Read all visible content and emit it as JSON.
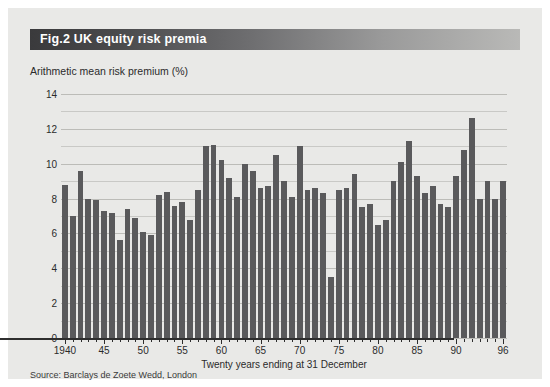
{
  "figure": {
    "label": "Fig.2",
    "title": "UK equity risk premia",
    "source": "Source: Barclays de Zoete Wedd, London",
    "accent_color": "#5a5a5c",
    "background_color": "#e9e9e7",
    "title_bar_dark": "#3a3a3c",
    "title_bar_light": "#b9b9b7"
  },
  "chart_data": {
    "type": "bar",
    "title": "UK equity risk premia",
    "ylabel": "Arithmetic mean risk premium (%)",
    "xlabel": "Twenty years ending at 31 December",
    "ylim": [
      0,
      14
    ],
    "ytick_labels": [
      "0",
      "2",
      "4",
      "6",
      "8",
      "10",
      "12",
      "14"
    ],
    "ytick_values": [
      0,
      2,
      4,
      6,
      8,
      10,
      12,
      14
    ],
    "grid": true,
    "grid_step": 1,
    "legend": "none",
    "xtick_labels": [
      "1940",
      "45",
      "50",
      "55",
      "60",
      "65",
      "70",
      "75",
      "80",
      "85",
      "90",
      "96"
    ],
    "xtick_years": [
      1940,
      1945,
      1950,
      1955,
      1960,
      1965,
      1970,
      1975,
      1980,
      1985,
      1990,
      1996
    ],
    "categories": [
      1940,
      1941,
      1942,
      1943,
      1944,
      1945,
      1946,
      1947,
      1948,
      1949,
      1950,
      1951,
      1952,
      1953,
      1954,
      1955,
      1956,
      1957,
      1958,
      1959,
      1960,
      1961,
      1962,
      1963,
      1964,
      1965,
      1966,
      1967,
      1968,
      1969,
      1970,
      1971,
      1972,
      1973,
      1974,
      1975,
      1976,
      1977,
      1978,
      1979,
      1980,
      1981,
      1982,
      1983,
      1984,
      1985,
      1986,
      1987,
      1988,
      1989,
      1990,
      1991,
      1992,
      1993,
      1994,
      1995,
      1996
    ],
    "values": [
      8.8,
      7.0,
      9.6,
      8.0,
      7.9,
      7.3,
      7.2,
      5.6,
      7.4,
      6.9,
      6.1,
      5.9,
      8.2,
      8.4,
      7.6,
      7.8,
      6.8,
      8.5,
      11.0,
      11.1,
      10.2,
      9.2,
      8.1,
      10.0,
      9.6,
      8.6,
      8.7,
      10.5,
      9.0,
      8.1,
      11.0,
      8.5,
      8.6,
      8.3,
      3.5,
      8.5,
      8.6,
      9.4,
      7.5,
      7.7,
      6.5,
      6.8,
      9.0,
      10.1,
      11.3,
      9.3,
      8.3,
      8.7,
      7.7,
      7.5,
      9.3,
      10.8,
      12.6,
      8.0,
      9.0,
      8.0,
      9.0
    ],
    "bar_color": "#5a5a5c"
  }
}
